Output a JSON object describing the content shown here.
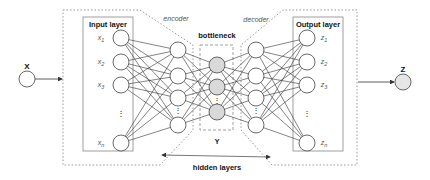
{
  "diagram": {
    "type": "autoencoder-architecture",
    "input": {
      "label": "X"
    },
    "output": {
      "label": "Z"
    },
    "input_layer": {
      "title": "Input layer",
      "nodes": [
        {
          "base": "x",
          "sub": "1"
        },
        {
          "base": "x",
          "sub": "2"
        },
        {
          "base": "x",
          "sub": "3"
        },
        {
          "base": "x",
          "sub": "n"
        }
      ],
      "ellipsis": "⋮"
    },
    "output_layer": {
      "title": "Output layer",
      "nodes": [
        {
          "base": "z",
          "sub": "1"
        },
        {
          "base": "z",
          "sub": "2"
        },
        {
          "base": "z",
          "sub": "3"
        },
        {
          "base": "z",
          "sub": "n"
        }
      ],
      "ellipsis": "⋮"
    },
    "labels": {
      "encoder": "encoder",
      "decoder": "decoder",
      "bottleneck": "bottleneck",
      "latent": "Y",
      "hidden_layers": "hidden layers"
    },
    "colors": {
      "node_fill": "#ffffff",
      "bottleneck_fill": "#d9d9d9",
      "output_fill": "#e6e6e6",
      "stroke": "#444444",
      "box_stroke": "#888888"
    }
  }
}
